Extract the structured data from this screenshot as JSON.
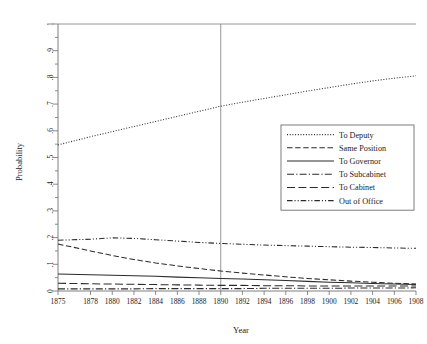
{
  "chart_data": {
    "type": "line",
    "title": "",
    "subtitle": "",
    "xlabel": "Year",
    "ylabel": "Probability",
    "xlim": [
      1875,
      1908
    ],
    "ylim": [
      0,
      1
    ],
    "grid": false,
    "legend_position": "center-right",
    "x_tick_labels": [
      "1875",
      "1878",
      "1880",
      "1882",
      "1884",
      "1886",
      "1888",
      "1890",
      "1892",
      "1894",
      "1896",
      "1898",
      "1900",
      "1902",
      "1904",
      "1906",
      "1908"
    ],
    "x_tick_values": [
      1875,
      1878,
      1880,
      1882,
      1884,
      1886,
      1888,
      1890,
      1892,
      1894,
      1896,
      1898,
      1900,
      1902,
      1904,
      1906,
      1908
    ],
    "y_tick_labels": [
      "0",
      ".1",
      ".2",
      ".3",
      ".4",
      ".5",
      ".6",
      ".7",
      ".8",
      ".9",
      "1"
    ],
    "y_tick_values": [
      0,
      0.1,
      0.2,
      0.3,
      0.4,
      0.5,
      0.6,
      0.7,
      0.8,
      0.9,
      1
    ],
    "y_minor_tick_values": [
      0.05,
      0.15,
      0.25,
      0.35,
      0.45,
      0.55,
      0.65,
      0.75,
      0.85,
      0.95
    ],
    "annotations": [
      {
        "name": "reference-line-1890",
        "type": "vline",
        "x": 1890,
        "label": ""
      },
      {
        "name": "reference-line-top",
        "type": "hline",
        "y": 1,
        "label": ""
      }
    ],
    "x": [
      1875,
      1878,
      1880,
      1882,
      1884,
      1886,
      1888,
      1890,
      1892,
      1894,
      1896,
      1898,
      1900,
      1902,
      1904,
      1906,
      1908
    ],
    "series": [
      {
        "name": "To Deputy",
        "style": "dotted",
        "values": [
          0.547,
          0.578,
          0.597,
          0.616,
          0.635,
          0.654,
          0.673,
          0.692,
          0.707,
          0.721,
          0.735,
          0.749,
          0.762,
          0.775,
          0.787,
          0.797,
          0.806
        ]
      },
      {
        "name": "Same Position",
        "style": "dashed",
        "values": [
          0.176,
          0.15,
          0.133,
          0.118,
          0.105,
          0.094,
          0.084,
          0.075,
          0.067,
          0.06,
          0.053,
          0.047,
          0.042,
          0.037,
          0.033,
          0.029,
          0.026
        ]
      },
      {
        "name": "To Governor",
        "style": "solid",
        "values": [
          0.064,
          0.061,
          0.059,
          0.057,
          0.055,
          0.052,
          0.05,
          0.047,
          0.045,
          0.042,
          0.039,
          0.036,
          0.033,
          0.031,
          0.028,
          0.026,
          0.024
        ]
      },
      {
        "name": "To Subcabinet",
        "style": "dash-dot",
        "values": [
          0.008,
          0.008,
          0.008,
          0.008,
          0.009,
          0.009,
          0.009,
          0.009,
          0.009,
          0.01,
          0.01,
          0.01,
          0.01,
          0.011,
          0.011,
          0.011,
          0.012
        ]
      },
      {
        "name": "To Cabinet",
        "style": "long-dash",
        "values": [
          0.029,
          0.027,
          0.026,
          0.025,
          0.024,
          0.023,
          0.022,
          0.021,
          0.021,
          0.02,
          0.02,
          0.019,
          0.019,
          0.019,
          0.019,
          0.019,
          0.019
        ]
      },
      {
        "name": "Out of Office",
        "style": "dash-dot-dot",
        "values": [
          0.19,
          0.194,
          0.199,
          0.197,
          0.192,
          0.187,
          0.182,
          0.178,
          0.175,
          0.172,
          0.17,
          0.168,
          0.166,
          0.164,
          0.163,
          0.161,
          0.16
        ]
      }
    ]
  },
  "legend": {
    "entries": [
      {
        "label": "To Deputy"
      },
      {
        "label": "Same Position"
      },
      {
        "label": "To Governor"
      },
      {
        "label": "To Subcabinet"
      },
      {
        "label": "To Cabinet"
      },
      {
        "label": "Out of Office"
      }
    ]
  },
  "axes": {
    "x_title": "Year",
    "y_title": "Probability"
  }
}
